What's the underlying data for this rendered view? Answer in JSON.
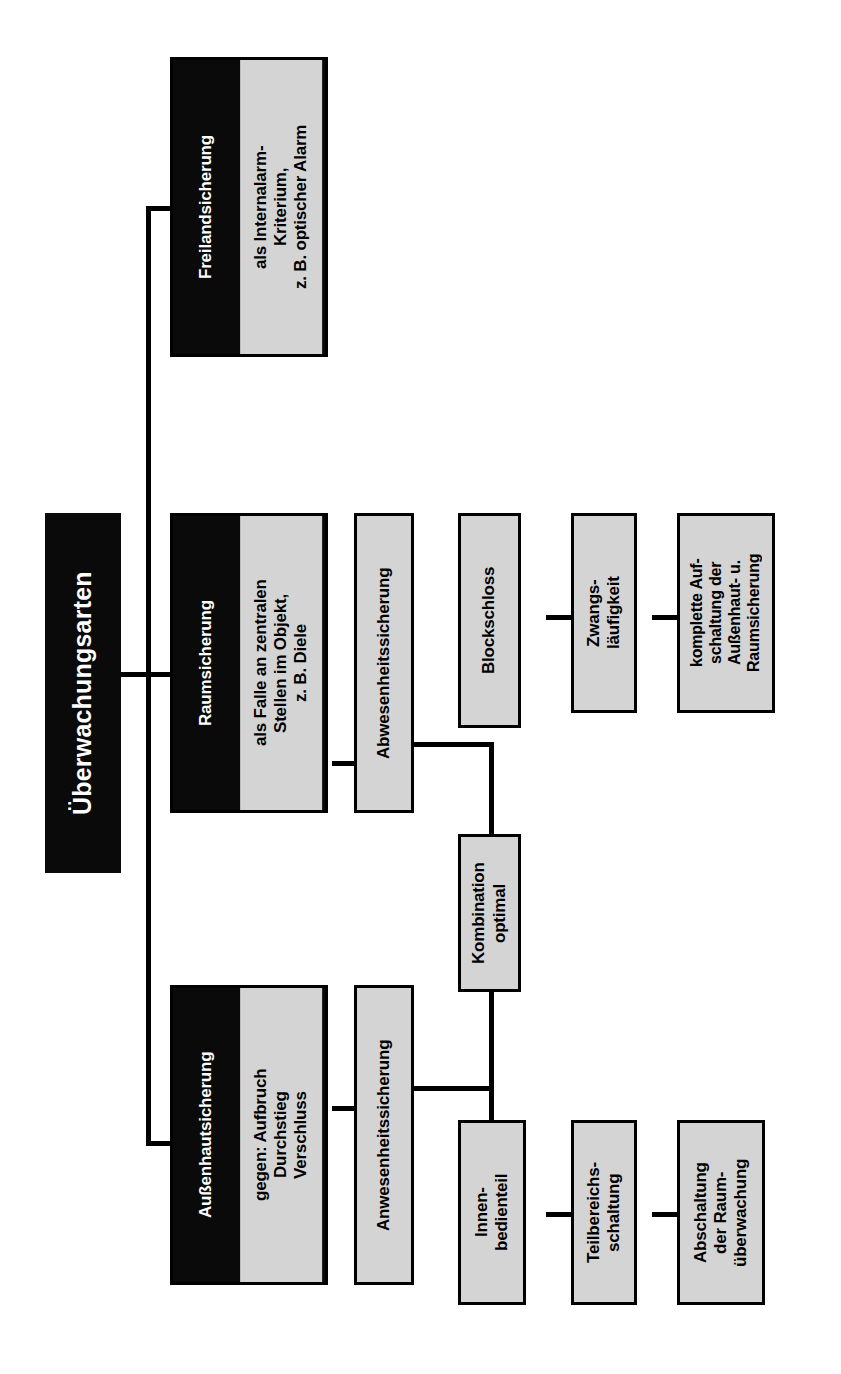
{
  "diagram": {
    "title": "Überwachungsarten",
    "orientation": "rotated-90-ccw",
    "language": "de",
    "colors": {
      "node_fill": "#d4d4d4",
      "node_border": "#000000",
      "category_fill": "#0a0a0a",
      "category_text": "#ffffff",
      "background": "#ffffff",
      "connector": "#000000"
    },
    "root": {
      "label": "Überwachungsarten"
    },
    "categories": [
      {
        "id": "freilandsicherung",
        "title": "Freilandsicherung",
        "detail": "als Internalarm-\nKriterium,\nz. B. optischer Alarm"
      },
      {
        "id": "raumsicherung",
        "title": "Raumsicherung",
        "detail": "als Falle an zentralen\nStellen im Objekt,\nz. B. Diele"
      },
      {
        "id": "aussenhautsicherung",
        "title": "Außenhautsicherung",
        "detail": "gegen: Aufbruch\nDurchstieg\nVerschluss"
      }
    ],
    "nodes": [
      {
        "id": "abwesenheitssicherung",
        "label": "Abwesenheitssicherung"
      },
      {
        "id": "anwesenheitssicherung",
        "label": "Anwesenheitssicherung"
      },
      {
        "id": "kombination",
        "label": "Kombination\noptimal"
      },
      {
        "id": "blockschloss",
        "label": "Blockschloss"
      },
      {
        "id": "zwangslaeufigkeit",
        "label": "Zwangs-\nläufigkeit"
      },
      {
        "id": "komplette-aufschaltung",
        "label": "komplette Auf-\nschaltung der\nAußenhaut- u.\nRaumsicherung"
      },
      {
        "id": "innenbedienteil",
        "label": "Innen-\nbedienteil"
      },
      {
        "id": "teilbereichsschaltung",
        "label": "Teilbereichs-\nschaltung"
      },
      {
        "id": "abschaltung-raumueberwachung",
        "label": "Abschaltung\nder Raum-\nüberwachung"
      }
    ]
  }
}
